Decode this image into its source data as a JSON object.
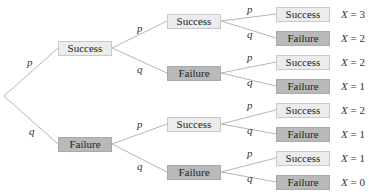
{
  "diagram": {
    "type": "probability-tree",
    "branch_labels": {
      "success": "p",
      "failure": "q"
    },
    "level1": [
      {
        "outcome": "Success",
        "branch": "p"
      },
      {
        "outcome": "Failure",
        "branch": "q"
      }
    ],
    "level2": [
      {
        "outcome": "Success",
        "branch": "p"
      },
      {
        "outcome": "Failure",
        "branch": "q"
      },
      {
        "outcome": "Success",
        "branch": "p"
      },
      {
        "outcome": "Failure",
        "branch": "q"
      }
    ],
    "level3": [
      {
        "outcome": "Success",
        "branch": "p",
        "x_label": "X",
        "x_eq": "= 3"
      },
      {
        "outcome": "Failure",
        "branch": "q",
        "x_label": "X",
        "x_eq": "= 2"
      },
      {
        "outcome": "Success",
        "branch": "p",
        "x_label": "X",
        "x_eq": "= 2"
      },
      {
        "outcome": "Failure",
        "branch": "q",
        "x_label": "X",
        "x_eq": "= 1"
      },
      {
        "outcome": "Success",
        "branch": "p",
        "x_label": "X",
        "x_eq": "= 2"
      },
      {
        "outcome": "Failure",
        "branch": "q",
        "x_label": "X",
        "x_eq": "= 1"
      },
      {
        "outcome": "Success",
        "branch": "p",
        "x_label": "X",
        "x_eq": "= 1"
      },
      {
        "outcome": "Failure",
        "branch": "q",
        "x_label": "X",
        "x_eq": "= 0"
      }
    ],
    "colors": {
      "success_fill": "#ececec",
      "failure_fill": "#b9b9b9",
      "edge": "#b5b5b5"
    }
  }
}
